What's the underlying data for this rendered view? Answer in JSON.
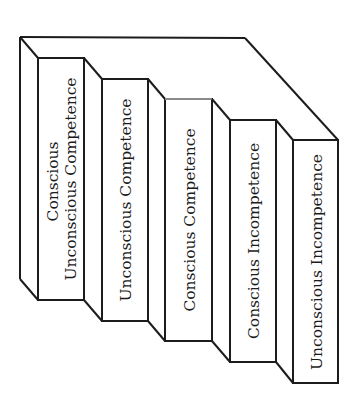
{
  "diagram": {
    "title": "",
    "type": "staircase",
    "orientation": "rotated-90-ccw",
    "colors": {
      "line": "#1c1c1c",
      "background": "#ffffff",
      "accent_edge": "#8a8a8a"
    },
    "steps": [
      {
        "id": 1,
        "label_lines": [
          "Conscious",
          "Unconscious Competence"
        ]
      },
      {
        "id": 2,
        "label_lines": [
          "Unconscious Competence"
        ]
      },
      {
        "id": 3,
        "label_lines": [
          "Conscious Competence"
        ]
      },
      {
        "id": 4,
        "label_lines": [
          "Conscious Incompetence"
        ]
      },
      {
        "id": 5,
        "label_lines": [
          "Unconscious Incompetence"
        ]
      }
    ]
  }
}
